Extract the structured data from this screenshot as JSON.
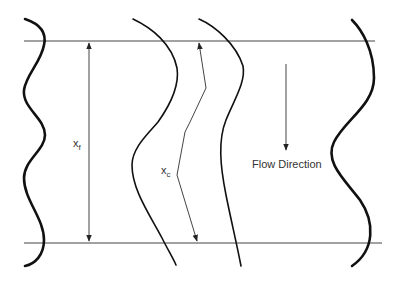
{
  "diagram": {
    "title": "",
    "labels": {
      "front_spacing": {
        "main": "x",
        "sub": "f"
      },
      "center_spacing": {
        "main": "x",
        "sub": "c"
      },
      "flow_direction": "Flow Direction"
    },
    "colors": {
      "background": "#ffffff",
      "thick_curve": "#111111",
      "thin_line": "#444444",
      "text": "#333333"
    },
    "reference_lines": [
      {
        "name": "top-boundary",
        "y": 41,
        "x1": 24,
        "x2": 375
      },
      {
        "name": "bottom-boundary",
        "y": 243,
        "x1": 24,
        "x2": 382
      }
    ],
    "curves": [
      {
        "name": "left-wavy-front",
        "stroke_width": 2.6
      },
      {
        "name": "center-left-curve",
        "stroke_width": 1.6
      },
      {
        "name": "center-right-curve",
        "stroke_width": 1.6
      },
      {
        "name": "right-wavy-front",
        "stroke_width": 2.6
      }
    ]
  }
}
